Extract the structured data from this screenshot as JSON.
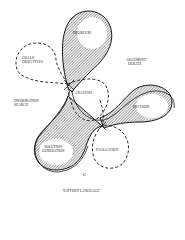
{
  "diagram": {
    "nodes": {
      "problem": "PROBLEM",
      "goals_line1": "GOALS/",
      "goals_line2": "OBJECTIVES",
      "argument_line1": "ARGUMENT/",
      "argument_line2": "DEBATE",
      "analysis": "ANALYSIS",
      "information_line1": "INFORMATION",
      "information_line2": "SEARCH",
      "decision": "DECISION",
      "solution_line1": "SOLUTION",
      "solution_line2": "GENERATION",
      "evaluation": "EVALUATION"
    },
    "figure_letter": "C",
    "caption": "\"PATTERN LANGUAGE\"",
    "colors": {
      "line": "#1a1a1a",
      "hatch": "#333333",
      "background": "#ffffff"
    }
  }
}
